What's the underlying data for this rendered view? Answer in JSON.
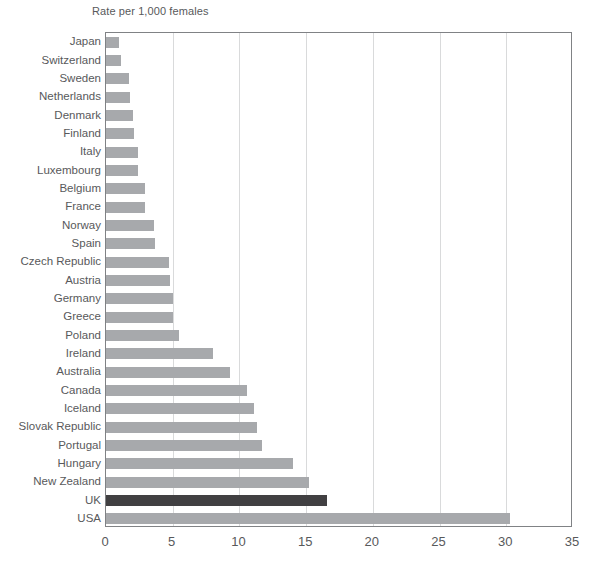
{
  "chart_data": {
    "type": "bar",
    "orientation": "horizontal",
    "title": "Rate per 1,000 females",
    "xlabel": "",
    "ylabel": "",
    "xlim": [
      0,
      35
    ],
    "xticks": [
      0,
      5,
      10,
      15,
      20,
      25,
      30,
      35
    ],
    "grid": true,
    "legend": "none",
    "bar_color": "#a7a9ac",
    "highlight_color": "#414042",
    "highlight_category": "UK",
    "categories": [
      "Japan",
      "Switzerland",
      "Sweden",
      "Netherlands",
      "Denmark",
      "Finland",
      "Italy",
      "Luxembourg",
      "Belgium",
      "France",
      "Norway",
      "Spain",
      "Czech Republic",
      "Austria",
      "Germany",
      "Greece",
      "Poland",
      "Ireland",
      "Australia",
      "Canada",
      "Iceland",
      "Slovak Republic",
      "Portugal",
      "Hungary",
      "New Zealand",
      "UK",
      "USA"
    ],
    "values": [
      1.0,
      1.1,
      1.7,
      1.8,
      2.0,
      2.1,
      2.4,
      2.4,
      2.9,
      2.9,
      3.6,
      3.7,
      4.7,
      4.8,
      5.0,
      5.0,
      5.5,
      8.0,
      9.3,
      10.6,
      11.1,
      11.3,
      11.7,
      14.0,
      15.2,
      16.6,
      30.3
    ]
  }
}
